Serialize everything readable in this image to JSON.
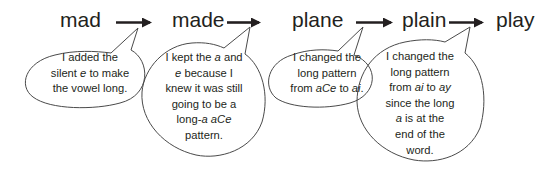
{
  "words": [
    {
      "text": "mad"
    },
    {
      "text": "made"
    },
    {
      "text": "plane"
    },
    {
      "text": "plain"
    },
    {
      "text": "play"
    }
  ],
  "notes": [
    {
      "lines": [
        [
          {
            "t": "I added the"
          }
        ],
        [
          {
            "t": "silent "
          },
          {
            "t": "e",
            "i": true
          },
          {
            "t": " to make"
          }
        ],
        [
          {
            "t": "the vowel long."
          }
        ]
      ],
      "text": "I added the silent e to make the vowel long."
    },
    {
      "lines": [
        [
          {
            "t": "I kept the "
          },
          {
            "t": "a",
            "i": true
          },
          {
            "t": " and"
          }
        ],
        [
          {
            "t": "e",
            "i": true
          },
          {
            "t": " because I"
          }
        ],
        [
          {
            "t": "knew it was still"
          }
        ],
        [
          {
            "t": "going to be a"
          }
        ],
        [
          {
            "t": "long-"
          },
          {
            "t": "a",
            "i": true
          },
          {
            "t": " "
          },
          {
            "t": "aCe",
            "i": true
          }
        ],
        [
          {
            "t": "pattern."
          }
        ]
      ],
      "text": "I kept the a and e because I knew it was still going to be a long-a aCe pattern."
    },
    {
      "lines": [
        [
          {
            "t": "I changed the"
          }
        ],
        [
          {
            "t": "long pattern"
          }
        ],
        [
          {
            "t": "from "
          },
          {
            "t": "aCe",
            "i": true
          },
          {
            "t": " to "
          },
          {
            "t": "ai",
            "i": true
          },
          {
            "t": "."
          }
        ]
      ],
      "text": "I changed the long pattern from aCe to ai."
    },
    {
      "lines": [
        [
          {
            "t": "I changed the"
          }
        ],
        [
          {
            "t": "long pattern"
          }
        ],
        [
          {
            "t": "from "
          },
          {
            "t": "ai",
            "i": true
          },
          {
            "t": " to "
          },
          {
            "t": "ay",
            "i": true
          }
        ],
        [
          {
            "t": "since the long"
          }
        ],
        [
          {
            "t": "a",
            "i": true
          },
          {
            "t": " is at the"
          }
        ],
        [
          {
            "t": "end of the"
          }
        ],
        [
          {
            "t": "word."
          }
        ]
      ],
      "text": "I changed the long pattern from ai to ay since the long a is at the end of the word."
    }
  ],
  "colors": {
    "ink": "#231f20",
    "background": "#ffffff",
    "bubble_stroke": "#4a4a4a"
  }
}
